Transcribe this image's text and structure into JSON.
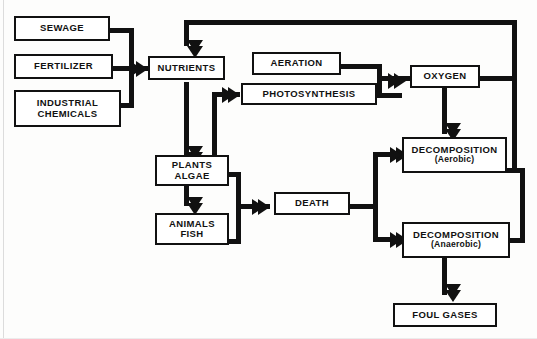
{
  "diagram": {
    "type": "flowchart",
    "background_color": "#ffffff",
    "line_color": "#111111",
    "caption": "",
    "nodes": [
      {
        "id": "sewage",
        "label": "SEWAGE",
        "sublabel": ""
      },
      {
        "id": "fertilizer",
        "label": "FERTILIZER",
        "sublabel": ""
      },
      {
        "id": "industrial",
        "label": "INDUSTRIAL",
        "sublabel": "CHEMICALS"
      },
      {
        "id": "nutrients",
        "label": "NUTRIENTS",
        "sublabel": ""
      },
      {
        "id": "aeration",
        "label": "AERATION",
        "sublabel": ""
      },
      {
        "id": "photosynthesis",
        "label": "PHOTOSYNTHESIS",
        "sublabel": ""
      },
      {
        "id": "oxygen",
        "label": "OXYGEN",
        "sublabel": ""
      },
      {
        "id": "plants",
        "label": "PLANTS",
        "sublabel": "ALGAE"
      },
      {
        "id": "animals",
        "label": "ANIMALS",
        "sublabel": "FISH"
      },
      {
        "id": "death",
        "label": "DEATH",
        "sublabel": ""
      },
      {
        "id": "decomp_aer",
        "label": "DECOMPOSITION",
        "sublabel": "(Aerobic)"
      },
      {
        "id": "decomp_anaer",
        "label": "DECOMPOSITION",
        "sublabel": "(Anaerobic)"
      },
      {
        "id": "foul_gases",
        "label": "FOUL  GASES",
        "sublabel": ""
      }
    ],
    "edges": [
      {
        "from": "sewage",
        "to": "nutrients"
      },
      {
        "from": "fertilizer",
        "to": "nutrients"
      },
      {
        "from": "industrial",
        "to": "nutrients"
      },
      {
        "from": "nutrients",
        "to": "plants"
      },
      {
        "from": "plants",
        "to": "photosynthesis"
      },
      {
        "from": "plants",
        "to": "animals"
      },
      {
        "from": "plants",
        "to": "death"
      },
      {
        "from": "animals",
        "to": "death"
      },
      {
        "from": "aeration",
        "to": "oxygen"
      },
      {
        "from": "photosynthesis",
        "to": "oxygen"
      },
      {
        "from": "oxygen",
        "to": "decomp_aer"
      },
      {
        "from": "death",
        "to": "decomp_aer"
      },
      {
        "from": "death",
        "to": "decomp_anaer"
      },
      {
        "from": "decomp_anaer",
        "to": "foul_gases"
      },
      {
        "from": "oxygen",
        "to": "nutrients"
      },
      {
        "from": "decomp_aer",
        "to": "nutrients"
      },
      {
        "from": "decomp_anaer",
        "to": "nutrients"
      }
    ]
  }
}
